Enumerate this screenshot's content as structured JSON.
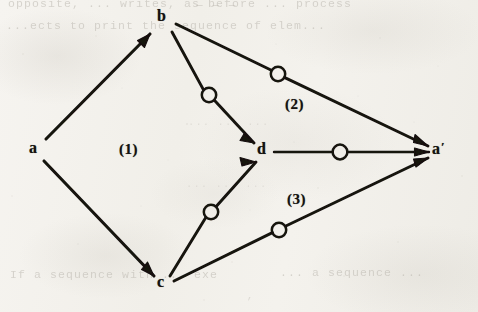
{
  "page": {
    "width": 478,
    "height": 312,
    "background_color": "#f4f2ee",
    "ink_color": "#141210",
    "ghost_ink_color": "#b9b5ad",
    "media": "scanned-book-page"
  },
  "diagram": {
    "kind": "directed-graph",
    "nodes": [
      {
        "id": "a",
        "label": "a",
        "x": 35,
        "y": 149
      },
      {
        "id": "b",
        "label": "b",
        "x": 164,
        "y": 18
      },
      {
        "id": "c",
        "label": "c",
        "x": 163,
        "y": 283
      },
      {
        "id": "d",
        "label": "d",
        "x": 264,
        "y": 151
      },
      {
        "id": "ap",
        "label": "a",
        "prime": "′",
        "x": 440,
        "y": 149
      }
    ],
    "edges": [
      {
        "id": "a-b",
        "from": "a",
        "to": "b",
        "marker": false
      },
      {
        "id": "a-c",
        "from": "a",
        "to": "c",
        "marker": false
      },
      {
        "id": "b-d",
        "from": "b",
        "to": "d",
        "marker": true,
        "marker_x": 209,
        "marker_y": 95
      },
      {
        "id": "b-ap",
        "from": "b",
        "to": "ap",
        "marker": true,
        "marker_x": 278,
        "marker_y": 74
      },
      {
        "id": "c-d",
        "from": "c",
        "to": "d",
        "marker": true,
        "marker_x": 211,
        "marker_y": 212
      },
      {
        "id": "c-ap",
        "from": "c",
        "to": "ap",
        "marker": true,
        "marker_x": 279,
        "marker_y": 230
      },
      {
        "id": "d-ap",
        "from": "d",
        "to": "ap",
        "marker": true,
        "marker_x": 340,
        "marker_y": 152
      }
    ],
    "region_labels": [
      {
        "id": "region-1",
        "text": "(1)",
        "x": 119,
        "y": 142
      },
      {
        "id": "region-2",
        "text": "(2)",
        "x": 285,
        "y": 97
      },
      {
        "id": "region-3",
        "text": "(3)",
        "x": 287,
        "y": 192
      }
    ]
  },
  "ghost_text": {
    "note": "Faint bleed-through text from the reverse side of the scanned page; partially illegible.",
    "top_1": "opposite, ... writes, as before ... process",
    "top_2": "— — —",
    "top_3": "...ects to print the sequence of elem...",
    "mid_1": "... ... ...",
    "mid_2": "... ... ...",
    "bottom_1": "If a sequence with ... exe",
    "bottom_2": "... a sequence ...",
    "bottom_3": "’"
  }
}
